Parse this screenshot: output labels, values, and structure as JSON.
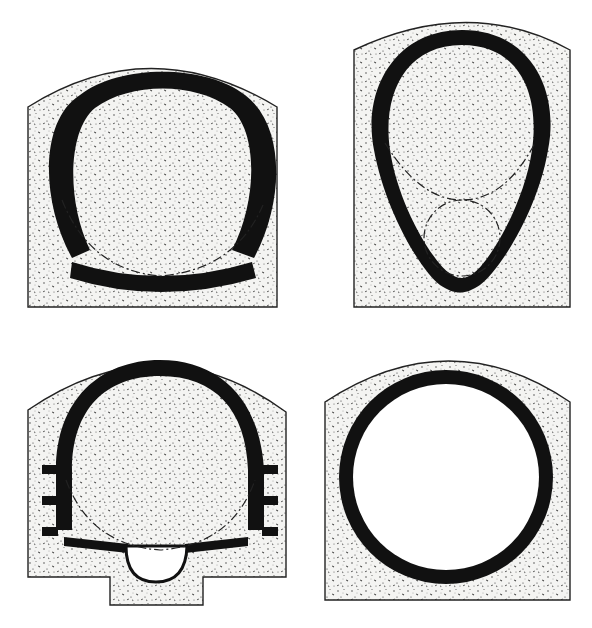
{
  "figure": {
    "type": "tunnel-cross-sections",
    "layout": "2x2 grid",
    "colors": {
      "background": "#ffffff",
      "lining": "#111111",
      "concrete_fill": "#f4f4f2",
      "stipple": "#333333",
      "outline": "#222222"
    },
    "sections": [
      {
        "id": "top-left",
        "shape": "horseshoe with flat curved invert",
        "features": [
          "dash-dot inner circle reference"
        ]
      },
      {
        "id": "top-right",
        "shape": "egg-shaped (ovoid)",
        "features": [
          "dash-dot upper arc reference",
          "dash-dot lower small circle reference"
        ]
      },
      {
        "id": "bottom-left",
        "shape": "horseshoe with side niches and central drain channel",
        "features": [
          "three side steps each wall",
          "semicircular drain",
          "dash-dot reference arc"
        ]
      },
      {
        "id": "bottom-right",
        "shape": "circular",
        "features": []
      }
    ]
  }
}
